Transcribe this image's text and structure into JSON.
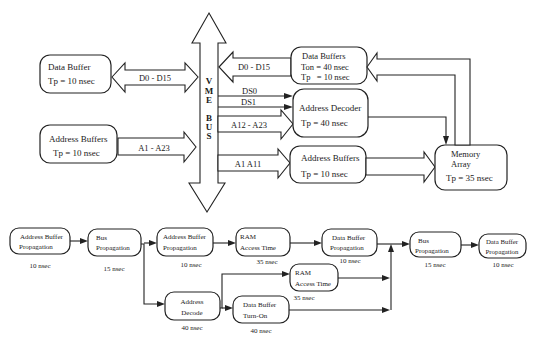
{
  "block_diagram": {
    "bus": {
      "letters": [
        "V",
        "M",
        "E",
        "B",
        "U",
        "S"
      ]
    },
    "left": {
      "data_buffer": {
        "title": "Data Buffer",
        "param": "Tp = 10 nsec"
      },
      "address_buffers": {
        "title": "Address Buffers",
        "param": "Tp = 10 nsec"
      },
      "data_link_label": "D0 - D15",
      "address_link_label": "A1 - A23"
    },
    "right": {
      "data_buffers": {
        "title": "Data Buffers",
        "param1": "Ton = 40 nsec",
        "param2": "Tp   = 10 nsec"
      },
      "address_decoder": {
        "title": "Address Decoder",
        "param": "Tp = 40 nsec"
      },
      "address_buffers": {
        "title": "Address Buffers",
        "param": "Tp = 10 nsec"
      },
      "memory_array": {
        "title1": "Memory",
        "title2": "Array",
        "param": "Tp = 35 nsec"
      },
      "data_link_label": "D0 - D15",
      "ds0_label": "DS0",
      "ds1_label": "DS1",
      "upper_addr_label": "A12 - A23",
      "lower_addr_label": "A1 A11"
    }
  },
  "timing_flow": {
    "nodes": [
      {
        "id": "n1",
        "line1": "Address Buffer",
        "line2": "Propagation",
        "time": "10 nsec"
      },
      {
        "id": "n2",
        "line1": "Bus",
        "line2": "Propagation",
        "time": "15 nsec"
      },
      {
        "id": "n3",
        "line1": "Address Buffer",
        "line2": "Propagation",
        "time": "10 nsec"
      },
      {
        "id": "n4",
        "line1": "RAM",
        "line2": "Access Time",
        "time": "35 nsec"
      },
      {
        "id": "n5",
        "line1": "Data Buffer",
        "line2": "Propagation",
        "time": "10 nsec"
      },
      {
        "id": "n6",
        "line1": "Address",
        "line2": "Decode",
        "time": "40 nsec"
      },
      {
        "id": "n7",
        "line1": "RAM",
        "line2": "Access Time",
        "time": "35 nsec"
      },
      {
        "id": "n8",
        "line1": "Data Buffer",
        "line2": "Turn-On",
        "time": "40 nsec"
      },
      {
        "id": "n9",
        "line1": "Bus",
        "line2": "Propagation",
        "time": "15 nsec"
      },
      {
        "id": "n10",
        "line1": "Data Buffer",
        "line2": "Propagation",
        "time": "10 nsec"
      }
    ]
  }
}
